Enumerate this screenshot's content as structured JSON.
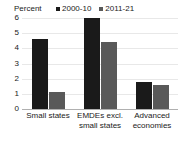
{
  "chart_data": {
    "type": "bar",
    "title": "",
    "subtitle": "",
    "xlabel": "",
    "ylabel": "Percent",
    "ylim": [
      0,
      6
    ],
    "ytick_values": [
      6,
      5,
      4,
      3,
      2,
      1,
      0
    ],
    "ytick_labels": [
      "6",
      "5",
      "4",
      "3",
      "2",
      "1",
      "0"
    ],
    "grid": true,
    "legend_position": "top",
    "categories": [
      "Small states",
      "EMDEs excl. small states",
      "Advanced economies"
    ],
    "category_label_lines": [
      [
        "Small states"
      ],
      [
        "EMDEs excl.",
        "small states"
      ],
      [
        "Advanced",
        "economies"
      ]
    ],
    "series": [
      {
        "name": "2000-10",
        "color": "#1a1a1a",
        "values": [
          4.6,
          6.0,
          1.8
        ]
      },
      {
        "name": "2011-21",
        "color": "#595959",
        "values": [
          1.1,
          4.4,
          1.6
        ]
      }
    ]
  },
  "colors": {
    "series_2000_10": "#1a1a1a",
    "series_2011_21": "#595959",
    "gridline": "#e8e8e8",
    "axis": "#b0b0b0",
    "background": "#ffffff",
    "text": "#1a1a1a"
  }
}
